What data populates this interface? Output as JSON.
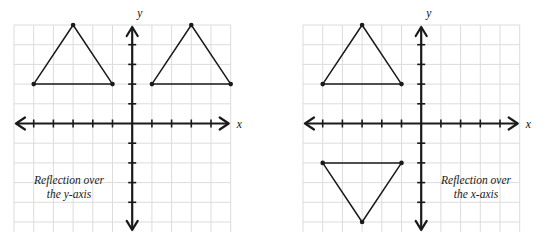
{
  "figure": {
    "background_color": "#ffffff",
    "grid_color": "#dcdcdc",
    "axis_color": "#1a1a1a",
    "shape_color": "#1a1a1a",
    "vertex_color": "#1a1a1a"
  },
  "panels": [
    {
      "id": "reflection-over-y-axis",
      "caption_line1": "Reflection over",
      "caption_line2": "the y-axis",
      "x_axis_label": "x",
      "y_axis_label": "y",
      "grid": {
        "cell_px": 19.7,
        "cols": 11,
        "rows": 10.5,
        "x_min": -6,
        "x_max": 5,
        "y_min": -5,
        "y_max": 5
      },
      "shapes": [
        {
          "name": "pre-image-triangle",
          "vertices": [
            {
              "x": -5,
              "y": 2
            },
            {
              "x": -3,
              "y": 5
            },
            {
              "x": -1,
              "y": 2
            }
          ]
        },
        {
          "name": "image-triangle",
          "vertices": [
            {
              "x": 1,
              "y": 2
            },
            {
              "x": 3,
              "y": 5
            },
            {
              "x": 5,
              "y": 2
            }
          ]
        }
      ]
    },
    {
      "id": "reflection-over-x-axis",
      "caption_line1": "Reflection over",
      "caption_line2": "the x-axis",
      "x_axis_label": "x",
      "y_axis_label": "y",
      "grid": {
        "cell_px": 19.7,
        "cols": 11,
        "rows": 10.5,
        "x_min": -6,
        "x_max": 5,
        "y_min": -5,
        "y_max": 5
      },
      "shapes": [
        {
          "name": "pre-image-triangle",
          "vertices": [
            {
              "x": -5,
              "y": 2
            },
            {
              "x": -3,
              "y": 5
            },
            {
              "x": -1,
              "y": 2
            }
          ]
        },
        {
          "name": "image-triangle",
          "vertices": [
            {
              "x": -5,
              "y": -2
            },
            {
              "x": -1,
              "y": -2
            },
            {
              "x": -3,
              "y": -5
            }
          ]
        }
      ]
    }
  ],
  "chart_data": {
    "type": "scatter",
    "xlabel": "x",
    "ylabel": "y",
    "xlim": [
      -6,
      5
    ],
    "ylim": [
      -5,
      5
    ],
    "grid": true,
    "legend_position": "none",
    "panels": [
      {
        "title": "Reflection over the y-axis",
        "series": [
          {
            "name": "pre-image triangle",
            "x": [
              -5,
              -3,
              -1,
              -5
            ],
            "y": [
              2,
              5,
              2,
              2
            ]
          },
          {
            "name": "image triangle",
            "x": [
              1,
              3,
              5,
              1
            ],
            "y": [
              2,
              5,
              2,
              2
            ]
          }
        ],
        "annotations": [
          "Reflection over",
          "the y-axis"
        ]
      },
      {
        "title": "Reflection over the x-axis",
        "series": [
          {
            "name": "pre-image triangle",
            "x": [
              -5,
              -3,
              -1,
              -5
            ],
            "y": [
              2,
              5,
              2,
              2
            ]
          },
          {
            "name": "image triangle",
            "x": [
              -5,
              -3,
              -1,
              -5
            ],
            "y": [
              -2,
              -5,
              -2,
              -2
            ]
          }
        ],
        "annotations": [
          "Reflection over",
          "the x-axis"
        ]
      }
    ]
  }
}
